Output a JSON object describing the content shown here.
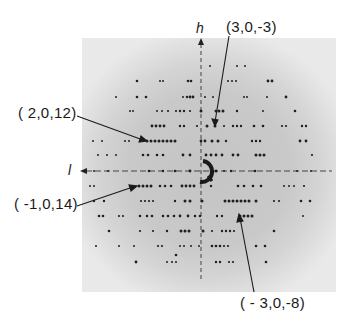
{
  "figure": {
    "type": "x-ray precession photograph (h0l reciprocal lattice plane)",
    "axes": {
      "vertical": {
        "label": "h",
        "direction": "up"
      },
      "horizontal": {
        "label": "l",
        "direction": "left"
      }
    },
    "annotations": [
      {
        "id": "ann-3-0-m3",
        "text": "(3,0,-3)"
      },
      {
        "id": "ann-2-0-12",
        "text": "( 2,0,12)"
      },
      {
        "id": "ann-m1-0-14",
        "text": "( -1,0,14)"
      },
      {
        "id": "ann-m3-0-m8",
        "text": "( - 3,0,-8)"
      }
    ],
    "colors": {
      "background": "#ffffff",
      "film": "#e9e9e9",
      "halo": "#c4c4c4",
      "spot": "#1f1f1f",
      "ink": "#1a1a1a"
    }
  }
}
